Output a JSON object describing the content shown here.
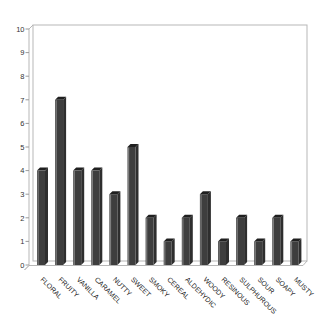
{
  "chart_data": {
    "type": "bar",
    "title": "",
    "categories": [
      "FLORAL",
      "FRUITY",
      "VANILLA",
      "CARAMEL",
      "NUTTY",
      "SWEET",
      "SMOKY",
      "CEREAL",
      "ALDEHYDIC",
      "WOODY",
      "RESINOUS",
      "SULPHUROUS",
      "SOUR",
      "SOAPY",
      "MUSTY"
    ],
    "values": [
      4,
      7,
      4,
      4,
      3,
      5,
      2,
      1,
      2,
      3,
      1,
      2,
      1,
      2,
      1
    ],
    "xlabel": "",
    "ylabel": "",
    "ylim": [
      0,
      10
    ],
    "ytick_labels": [
      "0",
      "1",
      "2",
      "3",
      "4",
      "5",
      "6",
      "7",
      "8",
      "9",
      "10"
    ],
    "grid": false,
    "legend": null,
    "effect": "3d-bars",
    "category_label_rotation_deg": 45,
    "colors": {
      "bar_front": "#3e3e3e",
      "bar_side": "#2e2e2e",
      "bar_top": "#1f1f1f",
      "bar_highlight": "#8a8a8a",
      "wall_line": "#b7b7b7",
      "tick_line": "#9a9a9a",
      "tick_label": "#333333",
      "category_label": "#222222",
      "background": "#ffffff"
    }
  }
}
